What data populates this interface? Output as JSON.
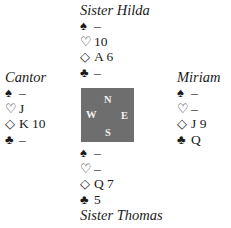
{
  "hands": {
    "north": {
      "name": "Sister Hilda",
      "spades": "–",
      "hearts": "10",
      "diamonds": "A 6",
      "clubs": "–"
    },
    "west": {
      "name": "Cantor",
      "spades": "–",
      "hearts": "J",
      "diamonds": "K 10",
      "clubs": "–"
    },
    "east": {
      "name": "Miriam",
      "spades": "–",
      "hearts": "–",
      "diamonds": "J 9",
      "clubs": "Q"
    },
    "south": {
      "name": "Sister Thomas",
      "spades": "–",
      "hearts": "–",
      "diamonds": "Q 7",
      "clubs": "5"
    }
  },
  "suits": {
    "spade": "♠",
    "heart": "♡",
    "diamond": "◇",
    "club": "♣"
  },
  "compass": {
    "n": "N",
    "w": "W",
    "e": "E",
    "s": "S",
    "color": "#6e6e6e"
  }
}
